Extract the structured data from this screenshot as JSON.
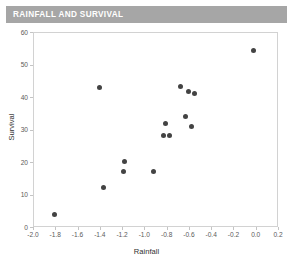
{
  "chart": {
    "title": "RAINFALL AND SURVIVAL",
    "banner_color": "#a6a6a6",
    "title_color": "#ffffff"
  },
  "chart_data": {
    "type": "scatter",
    "title": "RAINFALL AND SURVIVAL",
    "xlabel": "Rainfall",
    "ylabel": "Survival",
    "xlim": [
      -2.0,
      0.2
    ],
    "ylim": [
      0,
      60
    ],
    "grid": false,
    "legend": null,
    "marker_color": "#434343",
    "xticks": [
      "-2.0",
      "-1.8",
      "-1.6",
      "-1.4",
      "-1.2",
      "-1.0",
      "-0.8",
      "-0.6",
      "-0.4",
      "-0.2",
      "0.0",
      "0.2"
    ],
    "xtick_values": [
      -2.0,
      -1.8,
      -1.6,
      -1.4,
      -1.2,
      -1.0,
      -0.8,
      -0.6,
      -0.4,
      -0.2,
      0.0,
      0.2
    ],
    "yticks": [
      "0",
      "10",
      "20",
      "30",
      "40",
      "50",
      "60"
    ],
    "ytick_values": [
      0,
      10,
      20,
      30,
      40,
      50,
      60
    ],
    "points": [
      {
        "x": -1.81,
        "y": 4.0
      },
      {
        "x": -1.4,
        "y": 43.0
      },
      {
        "x": -1.37,
        "y": 12.2
      },
      {
        "x": -1.18,
        "y": 20.2
      },
      {
        "x": -1.19,
        "y": 17.2
      },
      {
        "x": -0.92,
        "y": 17.0
      },
      {
        "x": -0.81,
        "y": 32.0
      },
      {
        "x": -0.83,
        "y": 28.2
      },
      {
        "x": -0.77,
        "y": 28.2
      },
      {
        "x": -0.68,
        "y": 43.3
      },
      {
        "x": -0.63,
        "y": 34.0
      },
      {
        "x": -0.6,
        "y": 41.7
      },
      {
        "x": -0.58,
        "y": 31.0
      },
      {
        "x": -0.55,
        "y": 41.0
      },
      {
        "x": -0.02,
        "y": 54.2
      }
    ]
  }
}
